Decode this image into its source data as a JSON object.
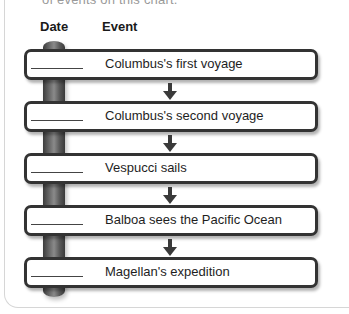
{
  "top_text": "of events on this chart.",
  "headers": {
    "date": "Date",
    "event": "Event"
  },
  "colors": {
    "box_border": "#333333",
    "pole": "#6a6a6a",
    "arrow": "#3a3a3a",
    "card_border": "#d6d6d6"
  },
  "events": [
    {
      "date_blank": "________",
      "label": "Columbus's first voyage"
    },
    {
      "date_blank": "________",
      "label": "Columbus's second voyage"
    },
    {
      "date_blank": "________",
      "label": "Vespucci sails"
    },
    {
      "date_blank": "________",
      "label": "Balboa sees the Pacific Ocean"
    },
    {
      "date_blank": "________",
      "label": "Magellan's expedition"
    }
  ],
  "arrow_icon": "down-arrow-icon"
}
